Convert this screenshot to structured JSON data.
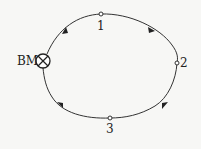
{
  "diagram": {
    "type": "closed leveling route",
    "direction": "clockwise",
    "benchmark": {
      "label": "BM",
      "symbol": "circle-x",
      "x": 43,
      "y": 61
    },
    "points": [
      {
        "label": "1",
        "x": 101,
        "y": 14
      },
      {
        "label": "2",
        "x": 177,
        "y": 63
      },
      {
        "label": "3",
        "x": 110,
        "y": 118
      }
    ],
    "route": [
      "BM",
      "1",
      "2",
      "3",
      "BM"
    ],
    "colors": {
      "line": "#333333",
      "background": "#f7f7f5",
      "node_fill": "#ffffff"
    }
  }
}
